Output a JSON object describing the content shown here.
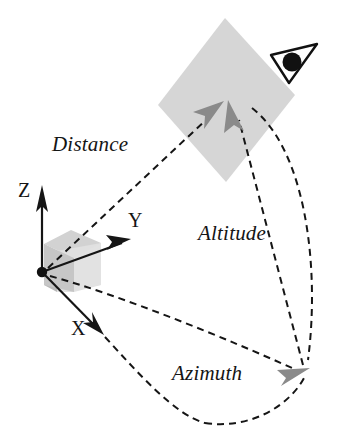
{
  "figure": {
    "background_color": "#ffffff",
    "stroke_color": "#151515",
    "fill_gray_plane": "#d4d4d4",
    "fill_gray_arrow": "#8c8c8c",
    "fill_gray_cube_light": "#e3e3e3",
    "fill_gray_cube_mid": "#cfcfcf",
    "fill_gray_cube_dark": "#b5b5b5"
  },
  "labels": {
    "distance": "Distance",
    "altitude": "Altitude",
    "azimuth": "Azimuth",
    "axis_z": "Z",
    "axis_y": "Y",
    "axis_x": "X"
  },
  "icons": {
    "eye": "eye-icon",
    "origin": "origin-dot",
    "z_arrowhead": "z-axis-arrowhead",
    "y_arrowhead": "y-axis-arrowhead",
    "x_arrowhead": "x-axis-arrowhead",
    "distance_arrowhead": "distance-arrowhead",
    "altitude_arrowhead": "altitude-arrowhead",
    "azimuth_arrowhead": "azimuth-arrowhead"
  },
  "geometry": {
    "origin": [
      42,
      272
    ],
    "axis_z_tip": [
      42,
      186
    ],
    "axis_y_tip": [
      128,
      241
    ],
    "axis_x_tip": [
      103,
      333
    ],
    "image_plane_points": "225,18 295,95 226,182 158,105",
    "image_plane_center": [
      226,
      100
    ],
    "eye_position": [
      296,
      62
    ],
    "azimuth_ground_point": [
      306,
      371
    ]
  }
}
